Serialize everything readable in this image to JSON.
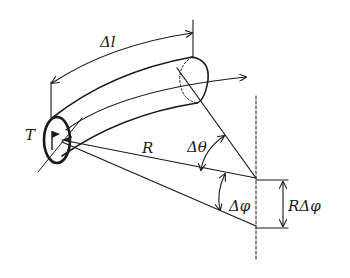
{
  "diagram": {
    "type": "physics-schematic",
    "labels": {
      "delta_l": "Δl",
      "torque": "T",
      "radius": "R",
      "delta_theta": "Δθ",
      "delta_phi": "Δφ",
      "arc_length": "RΔφ"
    },
    "colors": {
      "ink": "#1a1a1a",
      "background": "#ffffff"
    }
  }
}
